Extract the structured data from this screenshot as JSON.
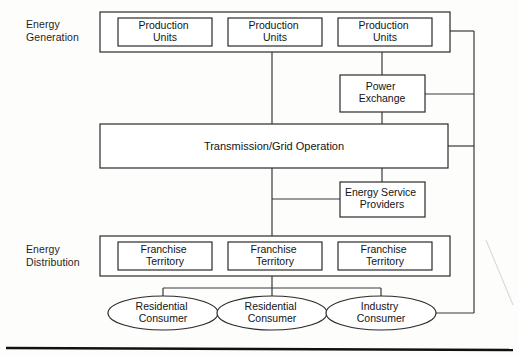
{
  "diagram": {
    "row_labels": [
      {
        "id": "energy-generation",
        "text": "Energy\nGeneration"
      },
      {
        "id": "energy-distribution",
        "text": "Energy\nDistribution"
      }
    ],
    "generation_units": [
      {
        "label": "Production\nUnits"
      },
      {
        "label": "Production\nUnits"
      },
      {
        "label": "Production\nUnits"
      }
    ],
    "power_exchange": {
      "label": "Power\nExchange"
    },
    "transmission": {
      "label": "Transmission/Grid Operation"
    },
    "energy_service_providers": {
      "label": "Energy Service\nProviders"
    },
    "franchise_territories": [
      {
        "label": "Franchise\nTerritory"
      },
      {
        "label": "Franchise\nTerritory"
      },
      {
        "label": "Franchise\nTerritory"
      }
    ],
    "consumers": [
      {
        "label": "Residential\nConsumer",
        "type": "residential"
      },
      {
        "label": "Residential\nConsumer",
        "type": "residential"
      },
      {
        "label": "Industry\nConsumer",
        "type": "industry"
      }
    ],
    "colors": {
      "stroke": "#2b2b2b",
      "connector": "#3a3a3a",
      "text": "#141414",
      "background": "#fdfdfc",
      "rule": "#111111"
    }
  }
}
